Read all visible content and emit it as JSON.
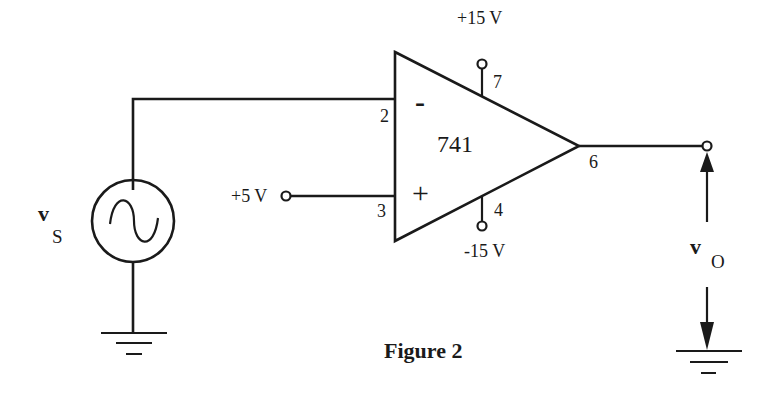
{
  "diagram": {
    "type": "op-amp circuit",
    "opamp": {
      "model": "741",
      "inverting_symbol": "-",
      "noninverting_symbol": "+",
      "pins": {
        "inverting": "2",
        "noninverting": "3",
        "output": "6",
        "vpos": "7",
        "vneg": "4"
      },
      "supply_pos": "+15 V",
      "supply_neg": "-15 V"
    },
    "source": {
      "label_main": "v",
      "label_sub": "S",
      "kind": "AC sinusoidal"
    },
    "reference_input": "+5 V",
    "output": {
      "label_main": "v",
      "label_sub": "O"
    },
    "caption": "Figure 2"
  }
}
